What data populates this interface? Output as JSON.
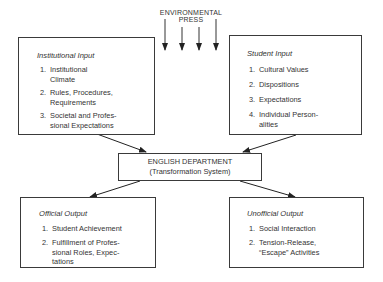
{
  "environmental_press": {
    "line1": "ENVIRONMENTAL",
    "line2": "PRESS",
    "arrow_count": 4
  },
  "institutional_input": {
    "title": "Institutional Input",
    "items": [
      {
        "num": "1.",
        "lines": [
          "Institutional",
          "Climate"
        ]
      },
      {
        "num": "2.",
        "lines": [
          "Rules, Procedures,",
          "Requirements"
        ]
      },
      {
        "num": "3.",
        "lines": [
          "Societal and Profes-",
          "sional Expectations"
        ]
      }
    ]
  },
  "student_input": {
    "title": "Student Input",
    "items": [
      {
        "num": "1.",
        "lines": [
          "Cultural Values"
        ]
      },
      {
        "num": "2.",
        "lines": [
          "Dispositions"
        ]
      },
      {
        "num": "3.",
        "lines": [
          "Expectations"
        ]
      },
      {
        "num": "4.",
        "lines": [
          "Individual Person-",
          "alities"
        ]
      }
    ]
  },
  "english_department": {
    "line1": "ENGLISH DEPARTMENT",
    "line2": "(Transformation System)"
  },
  "official_output": {
    "title": "Official Output",
    "items": [
      {
        "num": "1.",
        "lines": [
          "Student Achievement"
        ]
      },
      {
        "num": "2.",
        "lines": [
          "Fulfillment of Profes-",
          "sional Roles, Expec-",
          "tations"
        ]
      }
    ]
  },
  "unofficial_output": {
    "title": "Unofficial Output",
    "items": [
      {
        "num": "1.",
        "lines": [
          "Social Interaction"
        ]
      },
      {
        "num": "2.",
        "lines": [
          "Tension-Release,",
          "“Escape” Activities"
        ]
      }
    ]
  }
}
